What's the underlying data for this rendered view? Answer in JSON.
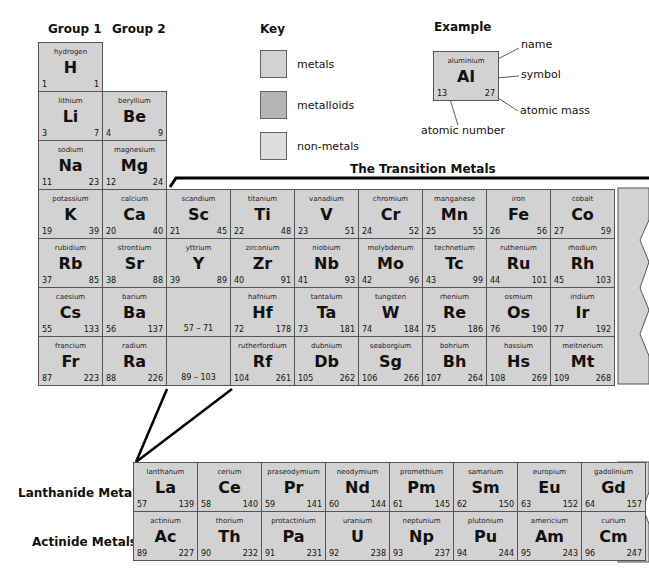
{
  "headers": {
    "group1": "Group 1",
    "group2": "Group 2",
    "key": "Key",
    "example": "Example",
    "transition": "The Transition Metals",
    "lanthanide": "Lanthanide Metals",
    "actinide": "Actinide Metals"
  },
  "key": [
    {
      "label": "metals",
      "color": "#d2d2d2"
    },
    {
      "label": "metalloids",
      "color": "#b5b5b5"
    },
    {
      "label": "non-metals",
      "color": "#dddddd"
    }
  ],
  "example": {
    "name": "aluminium",
    "symbol": "Al",
    "number": "13",
    "mass": "27",
    "labels": {
      "name": "name",
      "symbol": "symbol",
      "mass": "atomic mass",
      "number": "atomic number"
    }
  },
  "main": [
    {
      "n": "hydrogen",
      "s": "H",
      "z": "1",
      "m": "1",
      "r": 0,
      "c": 0
    },
    {
      "n": "lithium",
      "s": "Li",
      "z": "3",
      "m": "7",
      "r": 1,
      "c": 0
    },
    {
      "n": "beryllium",
      "s": "Be",
      "z": "4",
      "m": "9",
      "r": 1,
      "c": 1
    },
    {
      "n": "sodium",
      "s": "Na",
      "z": "11",
      "m": "23",
      "r": 2,
      "c": 0
    },
    {
      "n": "magnesium",
      "s": "Mg",
      "z": "12",
      "m": "24",
      "r": 2,
      "c": 1
    },
    {
      "n": "potassium",
      "s": "K",
      "z": "19",
      "m": "39",
      "r": 3,
      "c": 0
    },
    {
      "n": "calcium",
      "s": "Ca",
      "z": "20",
      "m": "40",
      "r": 3,
      "c": 1
    },
    {
      "n": "scandium",
      "s": "Sc",
      "z": "21",
      "m": "45",
      "r": 3,
      "c": 2
    },
    {
      "n": "titanium",
      "s": "Ti",
      "z": "22",
      "m": "48",
      "r": 3,
      "c": 3
    },
    {
      "n": "vanadium",
      "s": "V",
      "z": "23",
      "m": "51",
      "r": 3,
      "c": 4
    },
    {
      "n": "chromium",
      "s": "Cr",
      "z": "24",
      "m": "52",
      "r": 3,
      "c": 5
    },
    {
      "n": "manganese",
      "s": "Mn",
      "z": "25",
      "m": "55",
      "r": 3,
      "c": 6
    },
    {
      "n": "iron",
      "s": "Fe",
      "z": "26",
      "m": "56",
      "r": 3,
      "c": 7
    },
    {
      "n": "cobalt",
      "s": "Co",
      "z": "27",
      "m": "59",
      "r": 3,
      "c": 8
    },
    {
      "n": "rubidium",
      "s": "Rb",
      "z": "37",
      "m": "85",
      "r": 4,
      "c": 0
    },
    {
      "n": "strontium",
      "s": "Sr",
      "z": "38",
      "m": "88",
      "r": 4,
      "c": 1
    },
    {
      "n": "yttrium",
      "s": "Y",
      "z": "39",
      "m": "89",
      "r": 4,
      "c": 2
    },
    {
      "n": "zirconium",
      "s": "Zr",
      "z": "40",
      "m": "91",
      "r": 4,
      "c": 3
    },
    {
      "n": "niobium",
      "s": "Nb",
      "z": "41",
      "m": "93",
      "r": 4,
      "c": 4
    },
    {
      "n": "molybdenum",
      "s": "Mo",
      "z": "42",
      "m": "96",
      "r": 4,
      "c": 5
    },
    {
      "n": "technetium",
      "s": "Tc",
      "z": "43",
      "m": "99",
      "r": 4,
      "c": 6
    },
    {
      "n": "ruthenium",
      "s": "Ru",
      "z": "44",
      "m": "101",
      "r": 4,
      "c": 7
    },
    {
      "n": "rhodium",
      "s": "Rh",
      "z": "45",
      "m": "103",
      "r": 4,
      "c": 8
    },
    {
      "n": "caesium",
      "s": "Cs",
      "z": "55",
      "m": "133",
      "r": 5,
      "c": 0
    },
    {
      "n": "barium",
      "s": "Ba",
      "z": "56",
      "m": "137",
      "r": 5,
      "c": 1
    },
    {
      "n": "",
      "s": "",
      "z": "",
      "m": "",
      "range": "57 – 71",
      "r": 5,
      "c": 2
    },
    {
      "n": "hafnium",
      "s": "Hf",
      "z": "72",
      "m": "178",
      "r": 5,
      "c": 3
    },
    {
      "n": "tantalum",
      "s": "Ta",
      "z": "73",
      "m": "181",
      "r": 5,
      "c": 4
    },
    {
      "n": "tungsten",
      "s": "W",
      "z": "74",
      "m": "184",
      "r": 5,
      "c": 5
    },
    {
      "n": "rhenium",
      "s": "Re",
      "z": "75",
      "m": "186",
      "r": 5,
      "c": 6
    },
    {
      "n": "osmium",
      "s": "Os",
      "z": "76",
      "m": "190",
      "r": 5,
      "c": 7
    },
    {
      "n": "iridium",
      "s": "Ir",
      "z": "77",
      "m": "192",
      "r": 5,
      "c": 8
    },
    {
      "n": "francium",
      "s": "Fr",
      "z": "87",
      "m": "223",
      "r": 6,
      "c": 0
    },
    {
      "n": "radium",
      "s": "Ra",
      "z": "88",
      "m": "226",
      "r": 6,
      "c": 1
    },
    {
      "n": "",
      "s": "",
      "z": "",
      "m": "",
      "range": "89 – 103",
      "r": 6,
      "c": 2
    },
    {
      "n": "rutherfordium",
      "s": "Rf",
      "z": "104",
      "m": "261",
      "r": 6,
      "c": 3
    },
    {
      "n": "dubnium",
      "s": "Db",
      "z": "105",
      "m": "262",
      "r": 6,
      "c": 4
    },
    {
      "n": "seaborgium",
      "s": "Sg",
      "z": "106",
      "m": "266",
      "r": 6,
      "c": 5
    },
    {
      "n": "bohrium",
      "s": "Bh",
      "z": "107",
      "m": "264",
      "r": 6,
      "c": 6
    },
    {
      "n": "hassium",
      "s": "Hs",
      "z": "108",
      "m": "269",
      "r": 6,
      "c": 7
    },
    {
      "n": "meitnerium",
      "s": "Mt",
      "z": "109",
      "m": "268",
      "r": 6,
      "c": 8
    }
  ],
  "fblock": [
    {
      "n": "lanthanum",
      "s": "La",
      "z": "57",
      "m": "139",
      "r": 0,
      "c": 0
    },
    {
      "n": "cerium",
      "s": "Ce",
      "z": "58",
      "m": "140",
      "r": 0,
      "c": 1
    },
    {
      "n": "praseodymium",
      "s": "Pr",
      "z": "59",
      "m": "141",
      "r": 0,
      "c": 2
    },
    {
      "n": "neodymium",
      "s": "Nd",
      "z": "60",
      "m": "144",
      "r": 0,
      "c": 3
    },
    {
      "n": "promethium",
      "s": "Pm",
      "z": "61",
      "m": "145",
      "r": 0,
      "c": 4
    },
    {
      "n": "samarium",
      "s": "Sm",
      "z": "62",
      "m": "150",
      "r": 0,
      "c": 5
    },
    {
      "n": "europium",
      "s": "Eu",
      "z": "63",
      "m": "152",
      "r": 0,
      "c": 6
    },
    {
      "n": "gadolinium",
      "s": "Gd",
      "z": "64",
      "m": "157",
      "r": 0,
      "c": 7
    },
    {
      "n": "actinium",
      "s": "Ac",
      "z": "89",
      "m": "227",
      "r": 1,
      "c": 0
    },
    {
      "n": "thorium",
      "s": "Th",
      "z": "90",
      "m": "232",
      "r": 1,
      "c": 1
    },
    {
      "n": "protactinium",
      "s": "Pa",
      "z": "91",
      "m": "231",
      "r": 1,
      "c": 2
    },
    {
      "n": "uranium",
      "s": "U",
      "z": "92",
      "m": "238",
      "r": 1,
      "c": 3
    },
    {
      "n": "neptunium",
      "s": "Np",
      "z": "93",
      "m": "237",
      "r": 1,
      "c": 4
    },
    {
      "n": "plutonium",
      "s": "Pu",
      "z": "94",
      "m": "244",
      "r": 1,
      "c": 5
    },
    {
      "n": "americium",
      "s": "Am",
      "z": "95",
      "m": "243",
      "r": 1,
      "c": 6
    },
    {
      "n": "curium",
      "s": "Cm",
      "z": "96",
      "m": "247",
      "r": 1,
      "c": 7
    }
  ]
}
